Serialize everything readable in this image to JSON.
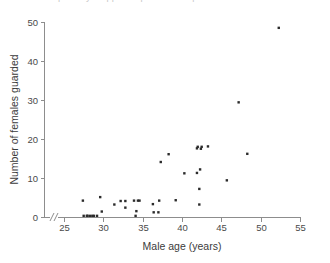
{
  "figure": {
    "caption_clipped": "partially cropped caption above plot",
    "background_color": "#ffffff",
    "point_color": "#2b2b2b",
    "axis_color": "#8d8d8d",
    "text_color": "#3b3b3b"
  },
  "chart_data": {
    "type": "scatter",
    "title": "",
    "xlabel": "Male age (years)",
    "ylabel": "Number of females guarded",
    "xlim": [
      25,
      55
    ],
    "ylim": [
      0,
      50
    ],
    "xticks": [
      25,
      30,
      35,
      40,
      45,
      50,
      55
    ],
    "xtick_labels": [
      "25",
      "30",
      "35",
      "40",
      "45",
      "50",
      "55"
    ],
    "yticks": [
      0,
      10,
      20,
      30,
      40,
      50
    ],
    "ytick_labels": [
      "0",
      "10",
      "20",
      "30",
      "40",
      "50"
    ],
    "grid": false,
    "legend": null,
    "axis_break": {
      "axis": "x",
      "symbol": "//",
      "note": "break between origin and first tick at 25"
    },
    "marker": {
      "shape": "square",
      "size_px": 2.4,
      "color": "#2b2b2b"
    },
    "series": [
      {
        "name": "males",
        "points": [
          [
            27.4,
            4.2
          ],
          [
            27.5,
            0.3
          ],
          [
            27.9,
            0.3
          ],
          [
            28.0,
            0.3
          ],
          [
            28.3,
            0.3
          ],
          [
            28.6,
            0.3
          ],
          [
            28.8,
            0.3
          ],
          [
            29.2,
            0.3
          ],
          [
            29.6,
            5.1
          ],
          [
            29.8,
            1.4
          ],
          [
            31.4,
            3.2
          ],
          [
            32.2,
            4.1
          ],
          [
            32.8,
            4.1
          ],
          [
            32.8,
            2.4
          ],
          [
            33.9,
            4.2
          ],
          [
            34.1,
            0.3
          ],
          [
            34.2,
            1.5
          ],
          [
            34.4,
            4.2
          ],
          [
            34.6,
            4.2
          ],
          [
            36.3,
            3.3
          ],
          [
            36.4,
            1.2
          ],
          [
            37.0,
            1.2
          ],
          [
            37.1,
            4.2
          ],
          [
            37.3,
            14.1
          ],
          [
            38.3,
            16.1
          ],
          [
            39.2,
            4.3
          ],
          [
            40.3,
            11.2
          ],
          [
            41.9,
            11.3
          ],
          [
            41.9,
            17.6
          ],
          [
            42.0,
            18.0
          ],
          [
            42.2,
            3.2
          ],
          [
            42.2,
            7.2
          ],
          [
            42.3,
            12.2
          ],
          [
            42.4,
            17.5
          ],
          [
            42.5,
            18.0
          ],
          [
            43.3,
            18.1
          ],
          [
            45.7,
            9.4
          ],
          [
            47.2,
            29.4
          ],
          [
            48.3,
            16.2
          ],
          [
            52.3,
            48.5
          ]
        ]
      }
    ]
  }
}
